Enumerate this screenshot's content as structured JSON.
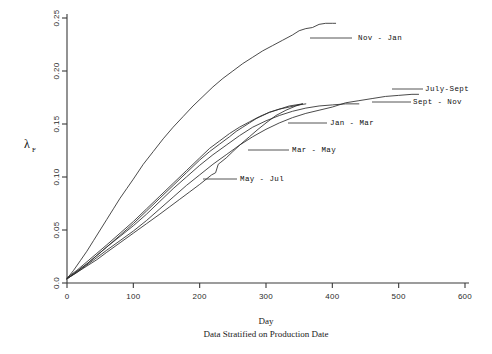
{
  "chart_data": {
    "type": "line",
    "title": "",
    "xlabel": "Day",
    "ylabel": "λ",
    "ylabel_sub": "F",
    "subtitle": "Data Stratified on Production Date",
    "xlim": [
      0,
      600
    ],
    "ylim": [
      0.0,
      0.25
    ],
    "xticks": [
      0,
      100,
      200,
      300,
      400,
      500,
      600
    ],
    "xtick_labels": [
      "0",
      "100",
      "200",
      "300",
      "400",
      "500",
      "600"
    ],
    "yticks": [
      0.0,
      0.05,
      0.1,
      0.15,
      0.2,
      0.25
    ],
    "ytick_labels": [
      "0.0",
      "0.05",
      "0.10",
      "0.15",
      "0.20",
      "0.25"
    ],
    "grid": false,
    "legend_position": "inline-annotations",
    "series": [
      {
        "name": "Nov - Jan",
        "label": "Nov - Jan",
        "x": [
          0,
          10,
          20,
          30,
          40,
          50,
          60,
          70,
          80,
          90,
          100,
          115,
          130,
          145,
          160,
          175,
          190,
          205,
          220,
          235,
          250,
          265,
          280,
          295,
          310,
          325,
          340,
          350,
          360,
          370,
          380,
          390,
          400,
          405
        ],
        "y": [
          0.004,
          0.012,
          0.021,
          0.03,
          0.04,
          0.05,
          0.06,
          0.07,
          0.08,
          0.089,
          0.098,
          0.112,
          0.124,
          0.136,
          0.147,
          0.157,
          0.167,
          0.176,
          0.185,
          0.193,
          0.2,
          0.207,
          0.213,
          0.219,
          0.224,
          0.229,
          0.234,
          0.238,
          0.24,
          0.241,
          0.244,
          0.245,
          0.245,
          0.245
        ]
      },
      {
        "name": "July-Sept",
        "label": "July-Sept",
        "x": [
          0,
          15,
          30,
          45,
          60,
          80,
          100,
          120,
          140,
          160,
          180,
          200,
          220,
          240,
          260,
          280,
          300,
          320,
          340,
          360,
          380,
          400,
          420,
          440,
          460,
          480,
          500,
          520,
          530
        ],
        "y": [
          0.004,
          0.01,
          0.017,
          0.024,
          0.031,
          0.04,
          0.049,
          0.059,
          0.07,
          0.081,
          0.092,
          0.102,
          0.112,
          0.121,
          0.13,
          0.138,
          0.145,
          0.151,
          0.156,
          0.16,
          0.163,
          0.166,
          0.17,
          0.172,
          0.174,
          0.176,
          0.177,
          0.178,
          0.178
        ]
      },
      {
        "name": "Sept - Nov",
        "label": "Sept - Nov",
        "x": [
          0,
          15,
          30,
          45,
          60,
          80,
          100,
          120,
          140,
          160,
          180,
          200,
          220,
          240,
          260,
          280,
          300,
          320,
          340,
          360,
          380,
          400,
          420,
          440
        ],
        "y": [
          0.004,
          0.011,
          0.018,
          0.026,
          0.034,
          0.044,
          0.054,
          0.065,
          0.077,
          0.089,
          0.1,
          0.111,
          0.121,
          0.13,
          0.139,
          0.147,
          0.153,
          0.158,
          0.162,
          0.165,
          0.167,
          0.168,
          0.169,
          0.169
        ]
      },
      {
        "name": "Jan - Mar",
        "label": "Jan - Mar",
        "x": [
          0,
          15,
          30,
          45,
          60,
          80,
          100,
          120,
          140,
          160,
          180,
          200,
          215,
          230,
          245,
          260,
          275,
          290,
          305,
          320,
          335,
          350,
          360
        ],
        "y": [
          0.005,
          0.012,
          0.02,
          0.028,
          0.036,
          0.047,
          0.058,
          0.07,
          0.082,
          0.094,
          0.106,
          0.118,
          0.127,
          0.134,
          0.141,
          0.147,
          0.152,
          0.157,
          0.161,
          0.164,
          0.166,
          0.168,
          0.169
        ]
      },
      {
        "name": "Mar - May",
        "label": "Mar - May",
        "x": [
          0,
          15,
          30,
          45,
          60,
          80,
          100,
          120,
          140,
          160,
          180,
          200,
          215,
          230,
          245,
          255,
          265,
          275,
          285,
          295,
          305,
          315,
          325,
          335,
          345,
          355
        ],
        "y": [
          0.004,
          0.011,
          0.018,
          0.026,
          0.034,
          0.045,
          0.056,
          0.068,
          0.08,
          0.092,
          0.104,
          0.116,
          0.124,
          0.131,
          0.138,
          0.143,
          0.147,
          0.151,
          0.155,
          0.158,
          0.161,
          0.163,
          0.165,
          0.167,
          0.168,
          0.169
        ]
      },
      {
        "name": "May - Jul",
        "label": "May - Jul",
        "x": [
          0,
          15,
          30,
          45,
          60,
          80,
          100,
          120,
          140,
          155,
          170,
          185,
          200,
          210,
          218,
          224,
          228,
          232,
          240,
          250,
          262,
          275,
          288,
          300,
          315,
          330,
          345,
          355
        ],
        "y": [
          0.004,
          0.01,
          0.016,
          0.022,
          0.029,
          0.038,
          0.047,
          0.056,
          0.065,
          0.072,
          0.079,
          0.086,
          0.093,
          0.098,
          0.102,
          0.104,
          0.112,
          0.114,
          0.118,
          0.124,
          0.131,
          0.138,
          0.145,
          0.151,
          0.158,
          0.163,
          0.167,
          0.169
        ]
      }
    ],
    "annotations": [
      {
        "label": "Nov - Jan",
        "text_x": 358,
        "text_y": 40,
        "leader_x1": 310,
        "leader_y1": 38,
        "leader_x2": 352,
        "leader_y2": 38
      },
      {
        "label": "July-Sept",
        "text_x": 425,
        "text_y": 91,
        "leader_x1": 392,
        "leader_y1": 89,
        "leader_x2": 423,
        "leader_y2": 89
      },
      {
        "label": "Sept - Nov",
        "text_x": 413,
        "text_y": 104,
        "leader_x1": 372,
        "leader_y1": 102,
        "leader_x2": 411,
        "leader_y2": 102
      },
      {
        "label": "Jan - Mar",
        "text_x": 330,
        "text_y": 125,
        "leader_x1": 288,
        "leader_y1": 123,
        "leader_x2": 327,
        "leader_y2": 123
      },
      {
        "label": "Mar - May",
        "text_x": 292,
        "text_y": 152,
        "leader_x1": 248,
        "leader_y1": 150,
        "leader_x2": 289,
        "leader_y2": 150
      },
      {
        "label": "May - Jul",
        "text_x": 240,
        "text_y": 181,
        "leader_x1": 203,
        "leader_y1": 179,
        "leader_x2": 237,
        "leader_y2": 179
      }
    ]
  }
}
